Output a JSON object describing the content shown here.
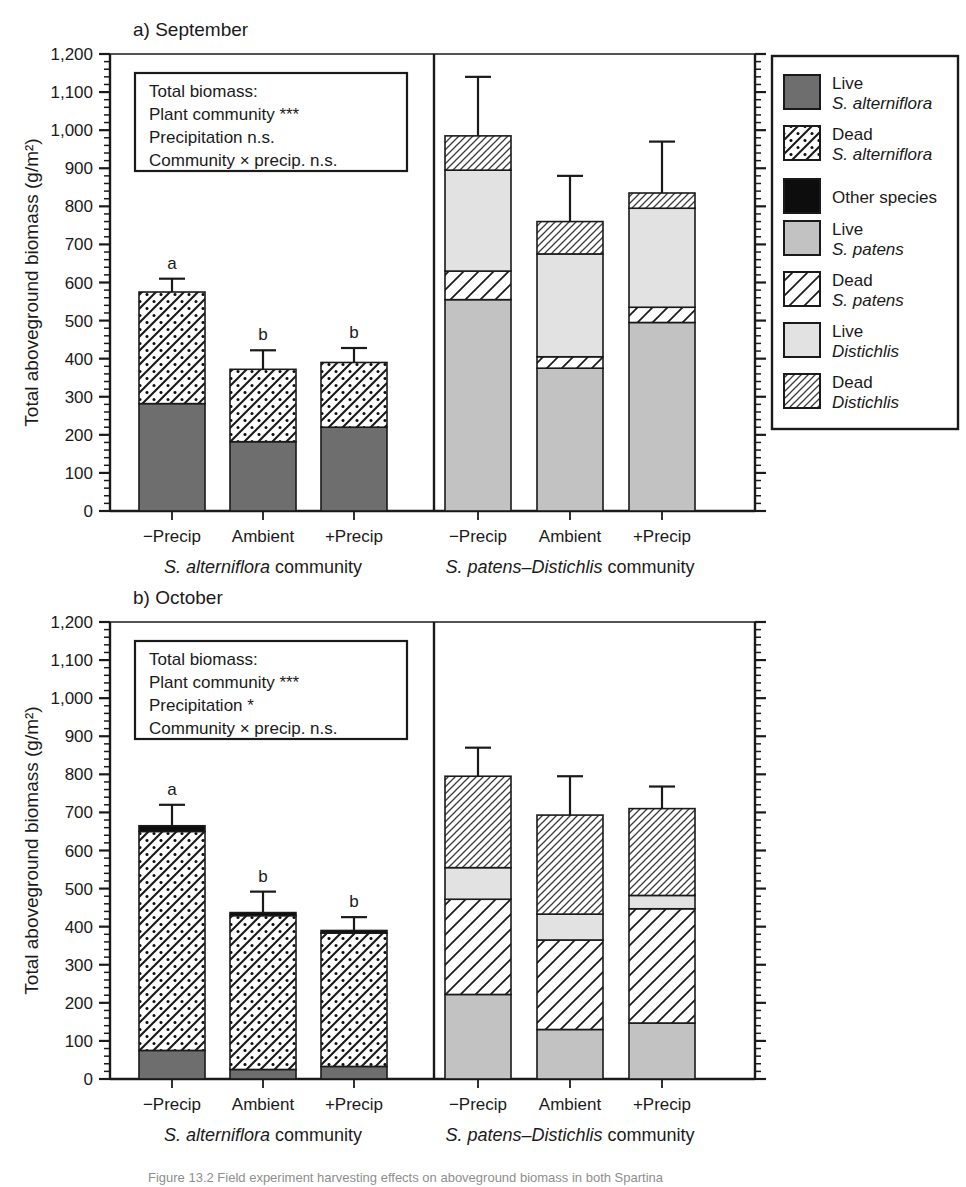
{
  "figure": {
    "caption_partial": "Figure 13.2  Field experiment harvesting effects on aboveground biomass in both Spartina",
    "y_axis_label": "Total aboveground biomass (g/m²)",
    "y_ticks": [
      "0",
      "100",
      "200",
      "300",
      "400",
      "500",
      "600",
      "700",
      "800",
      "900",
      "1,000",
      "1,100",
      "1,200"
    ],
    "categories": [
      "−Precip",
      "Ambient",
      "+Precip"
    ],
    "communities": [
      "S. alterniflora community",
      "S. patens–Distichlis community"
    ]
  },
  "panels": [
    {
      "id": "a",
      "title": "a) September",
      "stats": {
        "header": "Total biomass:",
        "lines": [
          "Plant community ***",
          "Precipitation n.s.",
          "Community × precip. n.s."
        ]
      }
    },
    {
      "id": "b",
      "title": "b) October",
      "stats": {
        "header": "Total biomass:",
        "lines": [
          "Plant community ***",
          "Precipitation *",
          "Community × precip. n.s."
        ]
      }
    }
  ],
  "legend": {
    "items": [
      {
        "swatch": "live-alterniflora",
        "line1": "Live",
        "line2": "S. alterniflora",
        "color": "#6e6e6e"
      },
      {
        "swatch": "dead-alterniflora",
        "line1": "Dead",
        "line2": "S. alterniflora",
        "color": "#ffffff"
      },
      {
        "swatch": "other-species",
        "line1": "Other species",
        "line2": "",
        "color": "#0d0d0d"
      },
      {
        "swatch": "live-patens",
        "line1": "Live",
        "line2": "S. patens",
        "color": "#c2c2c2"
      },
      {
        "swatch": "dead-patens",
        "line1": "Dead",
        "line2": "S. patens",
        "color": "#ffffff"
      },
      {
        "swatch": "live-distichlis",
        "line1": "Live",
        "line2": "Distichlis",
        "color": "#e2e2e2"
      },
      {
        "swatch": "dead-distichlis",
        "line1": "Dead",
        "line2": "Distichlis",
        "color": "#ffffff"
      }
    ]
  },
  "chart_data": {
    "type": "bar",
    "subtype": "stacked-bar",
    "xlabel": "",
    "ylabel": "Total aboveground biomass (g/m2)",
    "ylim": [
      0,
      1200
    ],
    "ytick_step": 100,
    "yminor_step": 20,
    "grid": false,
    "legend_position": "right",
    "error_bars": "upper SE only",
    "significance_letters_note": "Letters a/b denote Tukey groupings within the S. alterniflora community",
    "stack_order_bottom_to_top": [
      "Live S. alterniflora",
      "Dead S. alterniflora",
      "Other species",
      "Live S. patens",
      "Dead S. patens",
      "Live Distichlis",
      "Dead Distichlis"
    ],
    "panels": [
      {
        "panel": "a",
        "panel_title": "a) September",
        "groups": [
          {
            "community": "S. alterniflora community",
            "bars": [
              {
                "category": "−Precip",
                "letter": "a",
                "total": 575,
                "error_upper": 610,
                "segments": [
                  {
                    "name": "Live S. alterniflora",
                    "value": 282
                  },
                  {
                    "name": "Dead S. alterniflora",
                    "value": 293
                  }
                ]
              },
              {
                "category": "Ambient",
                "letter": "b",
                "total": 372,
                "error_upper": 422,
                "segments": [
                  {
                    "name": "Live S. alterniflora",
                    "value": 182
                  },
                  {
                    "name": "Dead S. alterniflora",
                    "value": 190
                  }
                ]
              },
              {
                "category": "+Precip",
                "letter": "b",
                "total": 390,
                "error_upper": 428,
                "segments": [
                  {
                    "name": "Live S. alterniflora",
                    "value": 220
                  },
                  {
                    "name": "Dead S. alterniflora",
                    "value": 170
                  }
                ]
              }
            ]
          },
          {
            "community": "S. patens–Distichlis community",
            "bars": [
              {
                "category": "−Precip",
                "letter": "",
                "total": 985,
                "error_upper": 1140,
                "segments": [
                  {
                    "name": "Live S. patens",
                    "value": 555
                  },
                  {
                    "name": "Dead S. patens",
                    "value": 75
                  },
                  {
                    "name": "Live Distichlis",
                    "value": 265
                  },
                  {
                    "name": "Dead Distichlis",
                    "value": 90
                  }
                ]
              },
              {
                "category": "Ambient",
                "letter": "",
                "total": 760,
                "error_upper": 880,
                "segments": [
                  {
                    "name": "Live S. patens",
                    "value": 375
                  },
                  {
                    "name": "Dead S. patens",
                    "value": 30
                  },
                  {
                    "name": "Live Distichlis",
                    "value": 270
                  },
                  {
                    "name": "Dead Distichlis",
                    "value": 85
                  }
                ]
              },
              {
                "category": "+Precip",
                "letter": "",
                "total": 835,
                "error_upper": 970,
                "segments": [
                  {
                    "name": "Live S. patens",
                    "value": 495
                  },
                  {
                    "name": "Dead S. patens",
                    "value": 40
                  },
                  {
                    "name": "Live Distichlis",
                    "value": 260
                  },
                  {
                    "name": "Dead Distichlis",
                    "value": 40
                  }
                ]
              }
            ]
          }
        ]
      },
      {
        "panel": "b",
        "panel_title": "b) October",
        "groups": [
          {
            "community": "S. alterniflora community",
            "bars": [
              {
                "category": "−Precip",
                "letter": "a",
                "total": 665,
                "error_upper": 720,
                "segments": [
                  {
                    "name": "Live S. alterniflora",
                    "value": 75
                  },
                  {
                    "name": "Dead S. alterniflora",
                    "value": 575
                  },
                  {
                    "name": "Other species",
                    "value": 15
                  }
                ]
              },
              {
                "category": "Ambient",
                "letter": "b",
                "total": 437,
                "error_upper": 492,
                "segments": [
                  {
                    "name": "Live S. alterniflora",
                    "value": 25
                  },
                  {
                    "name": "Dead S. alterniflora",
                    "value": 404
                  },
                  {
                    "name": "Other species",
                    "value": 8
                  }
                ]
              },
              {
                "category": "+Precip",
                "letter": "b",
                "total": 390,
                "error_upper": 425,
                "segments": [
                  {
                    "name": "Live S. alterniflora",
                    "value": 33
                  },
                  {
                    "name": "Dead S. alterniflora",
                    "value": 350
                  },
                  {
                    "name": "Other species",
                    "value": 7
                  }
                ]
              }
            ]
          },
          {
            "community": "S. patens–Distichlis community",
            "bars": [
              {
                "category": "−Precip",
                "letter": "",
                "total": 795,
                "error_upper": 870,
                "segments": [
                  {
                    "name": "Live S. patens",
                    "value": 222
                  },
                  {
                    "name": "Dead S. patens",
                    "value": 250
                  },
                  {
                    "name": "Live Distichlis",
                    "value": 83
                  },
                  {
                    "name": "Dead Distichlis",
                    "value": 240
                  }
                ]
              },
              {
                "category": "Ambient",
                "letter": "",
                "total": 693,
                "error_upper": 795,
                "segments": [
                  {
                    "name": "Live S. patens",
                    "value": 130
                  },
                  {
                    "name": "Dead S. patens",
                    "value": 235
                  },
                  {
                    "name": "Live Distichlis",
                    "value": 68
                  },
                  {
                    "name": "Dead Distichlis",
                    "value": 260
                  }
                ]
              },
              {
                "category": "+Precip",
                "letter": "",
                "total": 710,
                "error_upper": 768,
                "segments": [
                  {
                    "name": "Live S. patens",
                    "value": 147
                  },
                  {
                    "name": "Dead S. patens",
                    "value": 300
                  },
                  {
                    "name": "Live Distichlis",
                    "value": 35
                  },
                  {
                    "name": "Dead Distichlis",
                    "value": 228
                  }
                ]
              }
            ]
          }
        ]
      }
    ]
  }
}
